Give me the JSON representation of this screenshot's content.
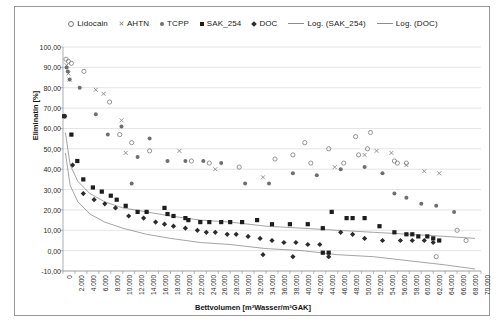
{
  "chart_data": {
    "type": "scatter",
    "title": "",
    "xlabel": "Bettvolumen [m³Wasser/m³GAK]",
    "ylabel": "Eliminatin [%]",
    "xlim": [
      0,
      70000
    ],
    "ylim": [
      -10,
      100
    ],
    "xticks": [
      "0",
      "2.000",
      "4.000",
      "6.000",
      "8.000",
      "10.000",
      "12.000",
      "14.000",
      "16.000",
      "18.000",
      "20.000",
      "22.000",
      "24.000",
      "26.000",
      "28.000",
      "30.000",
      "32.000",
      "34.000",
      "36.000",
      "38.000",
      "40.000",
      "42.000",
      "44.000",
      "46.000",
      "48.000",
      "50.000",
      "52.000",
      "54.000",
      "56.000",
      "58.000",
      "60.000",
      "62.000",
      "64.000",
      "66.000",
      "68.000",
      "70.000"
    ],
    "xtick_values": [
      0,
      2000,
      4000,
      6000,
      8000,
      10000,
      12000,
      14000,
      16000,
      18000,
      20000,
      22000,
      24000,
      26000,
      28000,
      30000,
      32000,
      34000,
      36000,
      38000,
      40000,
      42000,
      44000,
      46000,
      48000,
      50000,
      52000,
      54000,
      56000,
      58000,
      60000,
      62000,
      64000,
      66000,
      68000,
      70000
    ],
    "yticks": [
      "100,00",
      "90,00",
      "80,00",
      "70,00",
      "60,00",
      "50,00",
      "40,00",
      "30,00",
      "20,00",
      "10,00",
      "0,00",
      "-10,00"
    ],
    "ytick_values": [
      100,
      90,
      80,
      70,
      60,
      50,
      40,
      30,
      20,
      10,
      0,
      -10
    ],
    "grid": "horizontal",
    "legend_position": "top",
    "legend": [
      {
        "label": "Lidocain",
        "marker": "open-circle",
        "color": "#7b7b7b"
      },
      {
        "label": "AHTN",
        "marker": "x",
        "color": "#8a8a8a"
      },
      {
        "label": "TCPP",
        "marker": "filled-dot",
        "color": "#6e6e6e"
      },
      {
        "label": "SAK_254",
        "marker": "filled-square",
        "color": "#1d1d1d"
      },
      {
        "label": "DOC",
        "marker": "filled-diamond",
        "color": "#2b2b2b"
      },
      {
        "label": "Log. (SAK_254)",
        "marker": "line",
        "color": "#8d8d8d"
      },
      {
        "label": "Log. (DOC)",
        "marker": "line",
        "color": "#8d8d8d"
      }
    ],
    "series": [
      {
        "name": "Lidocain",
        "marker": "open-circle",
        "color": "#7b7b7b",
        "points": [
          [
            500,
            94
          ],
          [
            900,
            93
          ],
          [
            1400,
            92
          ],
          [
            3500,
            88
          ],
          [
            7800,
            73
          ],
          [
            9500,
            57
          ],
          [
            11500,
            53
          ],
          [
            14500,
            49
          ],
          [
            21500,
            44
          ],
          [
            24500,
            43
          ],
          [
            29500,
            41
          ],
          [
            38500,
            47
          ],
          [
            40500,
            53
          ],
          [
            44500,
            50
          ],
          [
            47000,
            43
          ],
          [
            49000,
            56
          ],
          [
            51500,
            58
          ],
          [
            51000,
            50
          ],
          [
            55500,
            44
          ],
          [
            56000,
            43
          ],
          [
            57500,
            43
          ],
          [
            49500,
            47
          ],
          [
            41500,
            43
          ],
          [
            66000,
            10
          ],
          [
            67500,
            5
          ],
          [
            62500,
            -3
          ],
          [
            35500,
            45
          ]
        ]
      },
      {
        "name": "AHTN",
        "marker": "x",
        "color": "#8a8a8a",
        "points": [
          [
            600,
            91
          ],
          [
            900,
            87
          ],
          [
            1100,
            84
          ],
          [
            6800,
            77
          ],
          [
            9800,
            64
          ],
          [
            5500,
            79
          ],
          [
            25500,
            40
          ],
          [
            33500,
            36
          ],
          [
            45500,
            41
          ],
          [
            50500,
            47
          ],
          [
            52500,
            49
          ],
          [
            55000,
            48
          ],
          [
            57500,
            42
          ],
          [
            60500,
            39
          ],
          [
            63000,
            38
          ],
          [
            19500,
            49
          ],
          [
            10500,
            48
          ]
        ]
      },
      {
        "name": "TCPP",
        "marker": "filled-dot",
        "color": "#6e6e6e",
        "points": [
          [
            600,
            90
          ],
          [
            800,
            88
          ],
          [
            1100,
            84
          ],
          [
            2800,
            80
          ],
          [
            5500,
            67
          ],
          [
            9800,
            61
          ],
          [
            14500,
            55
          ],
          [
            17500,
            44
          ],
          [
            20500,
            44
          ],
          [
            23500,
            44
          ],
          [
            26500,
            43
          ],
          [
            30500,
            33
          ],
          [
            34500,
            33
          ],
          [
            38500,
            38
          ],
          [
            42500,
            37
          ],
          [
            46500,
            40
          ],
          [
            50500,
            41
          ],
          [
            53500,
            38
          ],
          [
            55500,
            28
          ],
          [
            57500,
            26
          ],
          [
            60000,
            23
          ],
          [
            62500,
            22
          ],
          [
            65500,
            19
          ],
          [
            7500,
            57
          ],
          [
            12500,
            46
          ],
          [
            11500,
            33
          ]
        ]
      },
      {
        "name": "SAK_254",
        "marker": "filled-square",
        "color": "#1d1d1d",
        "points": [
          [
            200,
            66
          ],
          [
            1400,
            57
          ],
          [
            2400,
            44
          ],
          [
            3400,
            35
          ],
          [
            5000,
            31
          ],
          [
            6500,
            29
          ],
          [
            8000,
            27
          ],
          [
            9000,
            25
          ],
          [
            10500,
            22
          ],
          [
            12500,
            19
          ],
          [
            14000,
            19
          ],
          [
            17000,
            21
          ],
          [
            17500,
            18
          ],
          [
            18500,
            17
          ],
          [
            20500,
            16
          ],
          [
            21000,
            15
          ],
          [
            23000,
            14
          ],
          [
            24500,
            14
          ],
          [
            26500,
            14
          ],
          [
            28000,
            14
          ],
          [
            30000,
            14
          ],
          [
            32500,
            15
          ],
          [
            35000,
            13
          ],
          [
            38000,
            13
          ],
          [
            41000,
            13
          ],
          [
            43500,
            11
          ],
          [
            45000,
            19
          ],
          [
            47500,
            16
          ],
          [
            48500,
            16
          ],
          [
            50500,
            16
          ],
          [
            53000,
            12
          ],
          [
            55500,
            9
          ],
          [
            57500,
            8
          ],
          [
            58500,
            8
          ],
          [
            59500,
            7
          ],
          [
            61000,
            7
          ],
          [
            62000,
            6
          ],
          [
            63000,
            5
          ],
          [
            44500,
            -1
          ],
          [
            43500,
            -1
          ]
        ]
      },
      {
        "name": "DOC",
        "marker": "filled-diamond",
        "color": "#2b2b2b",
        "points": [
          [
            300,
            66
          ],
          [
            1600,
            42
          ],
          [
            3400,
            28
          ],
          [
            5200,
            25
          ],
          [
            7000,
            23
          ],
          [
            8800,
            21
          ],
          [
            11000,
            17
          ],
          [
            13500,
            16
          ],
          [
            15500,
            14
          ],
          [
            17000,
            13
          ],
          [
            18500,
            12
          ],
          [
            20500,
            11
          ],
          [
            22500,
            10
          ],
          [
            24000,
            9
          ],
          [
            25500,
            9
          ],
          [
            27500,
            8
          ],
          [
            29000,
            8
          ],
          [
            31000,
            7
          ],
          [
            33000,
            6
          ],
          [
            35000,
            5
          ],
          [
            37000,
            4
          ],
          [
            39000,
            4
          ],
          [
            41000,
            3
          ],
          [
            43000,
            3
          ],
          [
            46500,
            9
          ],
          [
            48500,
            8
          ],
          [
            50500,
            6
          ],
          [
            53500,
            5
          ],
          [
            56500,
            5
          ],
          [
            58500,
            5
          ],
          [
            60500,
            5
          ],
          [
            62000,
            4
          ],
          [
            33500,
            -2
          ],
          [
            38500,
            -3
          ],
          [
            44500,
            -3
          ]
        ]
      }
    ],
    "trendlines": [
      {
        "name": "Log. (SAK_254)",
        "color": "#8d8d8d",
        "model": "logarithmic",
        "path": [
          [
            400,
            58
          ],
          [
            1200,
            42
          ],
          [
            2500,
            34
          ],
          [
            4500,
            28
          ],
          [
            7000,
            24
          ],
          [
            10000,
            21
          ],
          [
            14000,
            19
          ],
          [
            18000,
            17
          ],
          [
            23000,
            15
          ],
          [
            28000,
            14
          ],
          [
            34000,
            12
          ],
          [
            40000,
            11
          ],
          [
            46000,
            10
          ],
          [
            52000,
            9
          ],
          [
            58000,
            8
          ],
          [
            64000,
            7
          ],
          [
            69000,
            6
          ]
        ]
      },
      {
        "name": "Log. (DOC)",
        "color": "#8d8d8d",
        "model": "logarithmic",
        "path": [
          [
            400,
            48
          ],
          [
            1200,
            32
          ],
          [
            2500,
            24
          ],
          [
            4500,
            18
          ],
          [
            7000,
            14
          ],
          [
            10000,
            11
          ],
          [
            14000,
            8
          ],
          [
            18000,
            6
          ],
          [
            23000,
            4
          ],
          [
            28000,
            3
          ],
          [
            34000,
            1
          ],
          [
            40000,
            0
          ],
          [
            46000,
            -2
          ],
          [
            52000,
            -3
          ],
          [
            58000,
            -5
          ],
          [
            64000,
            -7
          ],
          [
            69000,
            -9
          ]
        ]
      }
    ]
  }
}
